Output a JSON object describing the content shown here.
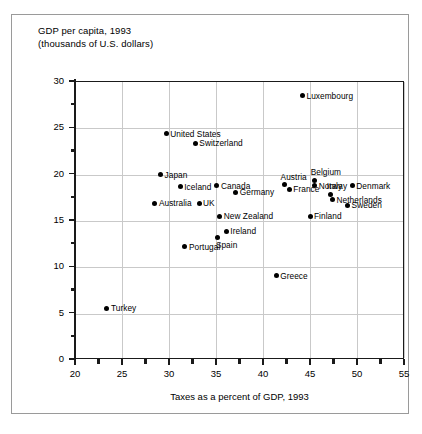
{
  "chart_data": {
    "type": "scatter",
    "title": "GDP per capita, 1993\n(thousands of U.S. dollars)",
    "ylabel": "GDP per capita, 1993 (thousands of U.S. dollars)",
    "xlabel": "Taxes as a percent of GDP, 1993",
    "xlim": [
      20,
      55
    ],
    "ylim": [
      0,
      30
    ],
    "x_ticks": [
      20,
      25,
      30,
      35,
      40,
      45,
      50,
      55
    ],
    "y_ticks": [
      0,
      5,
      10,
      15,
      20,
      25,
      30
    ],
    "x_minor_step": 2.5,
    "y_minor_step": 2.5,
    "grid": true,
    "legend": "none",
    "points": [
      {
        "label": "Luxembourg",
        "x": 44.2,
        "y": 28.5,
        "label_pos": "right"
      },
      {
        "label": "United States",
        "x": 29.7,
        "y": 24.4,
        "label_pos": "right"
      },
      {
        "label": "Switzerland",
        "x": 32.8,
        "y": 23.4,
        "label_pos": "right"
      },
      {
        "label": "Japan",
        "x": 29.1,
        "y": 20.0,
        "label_pos": "right"
      },
      {
        "label": "Iceland",
        "x": 31.2,
        "y": 18.7,
        "label_pos": "right"
      },
      {
        "label": "Canada",
        "x": 35.1,
        "y": 18.8,
        "label_pos": "right"
      },
      {
        "label": "Germany",
        "x": 37.1,
        "y": 18.1,
        "label_pos": "right"
      },
      {
        "label": "Austria",
        "x": 42.3,
        "y": 18.9,
        "label_pos": "above"
      },
      {
        "label": "France",
        "x": 42.8,
        "y": 18.4,
        "label_pos": "right"
      },
      {
        "label": "Belgium",
        "x": 45.5,
        "y": 19.4,
        "label_pos": "above"
      },
      {
        "label": "Norway",
        "x": 45.5,
        "y": 18.8,
        "label_pos": "right"
      },
      {
        "label": "Denmark",
        "x": 49.5,
        "y": 18.8,
        "label_pos": "right"
      },
      {
        "label": "Italy",
        "x": 47.2,
        "y": 17.9,
        "label_pos": "above"
      },
      {
        "label": "Netherlands",
        "x": 47.4,
        "y": 17.3,
        "label_pos": "right"
      },
      {
        "label": "Sweden",
        "x": 49.0,
        "y": 16.7,
        "label_pos": "right"
      },
      {
        "label": "Australia",
        "x": 28.5,
        "y": 16.9,
        "label_pos": "right"
      },
      {
        "label": "UK",
        "x": 33.2,
        "y": 16.9,
        "label_pos": "right"
      },
      {
        "label": "New Zealand",
        "x": 35.4,
        "y": 15.5,
        "label_pos": "right"
      },
      {
        "label": "Finland",
        "x": 45.0,
        "y": 15.5,
        "label_pos": "right"
      },
      {
        "label": "Ireland",
        "x": 36.1,
        "y": 13.9,
        "label_pos": "right"
      },
      {
        "label": "Spain",
        "x": 35.2,
        "y": 13.2,
        "label_pos": "below"
      },
      {
        "label": "Portugal",
        "x": 31.7,
        "y": 12.2,
        "label_pos": "right"
      },
      {
        "label": "Greece",
        "x": 41.4,
        "y": 9.1,
        "label_pos": "right"
      },
      {
        "label": "Turkey",
        "x": 23.4,
        "y": 5.6,
        "label_pos": "right"
      }
    ]
  },
  "colors": {
    "marker": "#000000",
    "grid": "#c9c9c9",
    "axis": "#1a1a1a",
    "frame": "#9a9a9a",
    "background": "#ffffff"
  }
}
